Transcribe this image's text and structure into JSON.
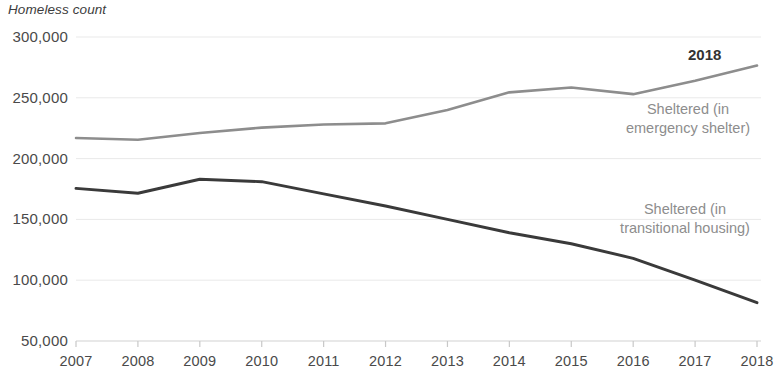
{
  "chart_data": {
    "type": "line",
    "title": "Homeless count",
    "xlabel": "",
    "ylabel": "Homeless count",
    "grid": true,
    "legend_position": "inline-right",
    "x": [
      2007,
      2008,
      2009,
      2010,
      2011,
      2012,
      2013,
      2014,
      2015,
      2016,
      2017,
      2018
    ],
    "xtick_labels": [
      "2007",
      "2008",
      "2009",
      "2010",
      "2011",
      "2012",
      "2013",
      "2014",
      "2015",
      "2016",
      "2017",
      "2018"
    ],
    "ytick_labels": [
      "300,000",
      "250,000",
      "200,000",
      "150,000",
      "100,000",
      "50,000"
    ],
    "ytick_values": [
      300000,
      250000,
      200000,
      150000,
      100000,
      50000
    ],
    "ylim": [
      50000,
      300000
    ],
    "xlim": [
      2007,
      2018
    ],
    "series": [
      {
        "name": "Sheltered (in emergency shelter)",
        "label_line1": "Sheltered (in",
        "label_line2": "emergency shelter)",
        "color": "#8d8d8d",
        "values": [
          217000,
          215500,
          221000,
          225500,
          228000,
          229000,
          240000,
          254500,
          258500,
          253000,
          264000,
          276500
        ]
      },
      {
        "name": "Sheltered (in transitional housing)",
        "label_line1": "Sheltered (in",
        "label_line2": "transitional housing)",
        "color": "#3a3a3a",
        "values": [
          175500,
          171500,
          183000,
          181000,
          171000,
          161000,
          150000,
          139000,
          130000,
          118000,
          100000,
          81500
        ]
      }
    ],
    "annotations": [
      {
        "text": "2018",
        "x_value": 2018,
        "y_value": 283000
      }
    ]
  }
}
